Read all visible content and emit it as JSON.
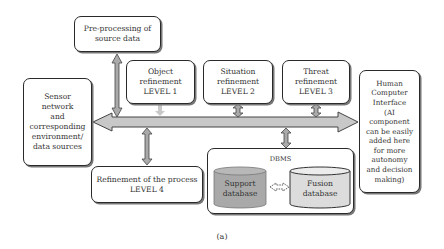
{
  "diagram": {
    "caption": "(a)",
    "nodes": {
      "preprocessing": "Pre-processing of\nsource data",
      "level1": "Object\nrefinement\nLEVEL 1",
      "level2": "Situation\nrefinement\nLEVEL 2",
      "level3": "Threat\nrefinement\nLEVEL 3",
      "sensor": "Sensor\nnetwork\nand\ncorresponding\nenvironment/\ndata sources",
      "hci": "Human\nComputer\nInterface\n(AI\ncomponent\ncan be easily\nadded here\nfor more\nautonomy\nand decision\nmaking)",
      "level4": "Refinement of the process\nLEVEL 4",
      "dbms": "DBMS",
      "support_db": "Support\ndatabase",
      "fusion_db": "Fusion\ndatabase"
    },
    "edges": [
      {
        "from": "preprocessing",
        "to": "bus",
        "type": "bidirectional"
      },
      {
        "from": "level1",
        "to": "bus",
        "type": "unidirectional-light"
      },
      {
        "from": "level2",
        "to": "bus",
        "type": "bidirectional"
      },
      {
        "from": "level3",
        "to": "bus",
        "type": "bidirectional"
      },
      {
        "from": "bus",
        "to": "sensor",
        "type": "arrow"
      },
      {
        "from": "bus",
        "to": "hci",
        "type": "arrow"
      },
      {
        "from": "level4",
        "to": "bus",
        "type": "bidirectional"
      },
      {
        "from": "dbms",
        "to": "bus",
        "type": "bidirectional"
      },
      {
        "from": "support_db",
        "to": "fusion_db",
        "type": "dashed-bidirectional"
      }
    ],
    "colors": {
      "bus_fill": "#c8c8c8",
      "support_db_fill": "#a9a9a9",
      "fusion_db_fill": "#dcdcdc",
      "border": "#2a2a2a"
    }
  }
}
